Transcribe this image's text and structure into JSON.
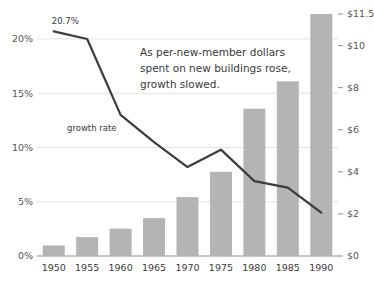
{
  "chart_data": {
    "type": "bar",
    "title": "",
    "subtitle": "",
    "annotation": {
      "lines": [
        "As per-new-member dollars",
        "spent on new buildings rose,",
        "growth slowed."
      ]
    },
    "categories": [
      "1950",
      "1955",
      "1960",
      "1965",
      "1970",
      "1975",
      "1980",
      "1985",
      "1990"
    ],
    "xlabel": "",
    "series": [
      {
        "name": "per-new-member dollars",
        "type": "bar",
        "axis": "right",
        "values": [
          0.5,
          0.9,
          1.3,
          1.8,
          2.8,
          4.0,
          7.0,
          8.3,
          11.5
        ],
        "color": "#b4b4b4"
      },
      {
        "name": "growth rate",
        "type": "line",
        "axis": "left",
        "values": [
          20.7,
          20.0,
          13.0,
          10.5,
          8.2,
          9.8,
          6.9,
          6.3,
          4.0
        ],
        "color": "#3c3c3c",
        "inline_label": "growth rate",
        "first_point_label": "20.7%"
      }
    ],
    "left_axis": {
      "ylabel": "",
      "ticks": [
        "0%",
        "5%",
        "10%",
        "15%",
        "20%"
      ],
      "tick_values": [
        0,
        5,
        10,
        15,
        20
      ],
      "ylim": [
        0,
        22.3
      ]
    },
    "right_axis": {
      "ylabel": "",
      "ticks": [
        "$0",
        "$2",
        "$4",
        "$6",
        "$8",
        "$10",
        "$11.5"
      ],
      "tick_values": [
        0,
        2,
        4,
        6,
        8,
        10,
        11.5
      ],
      "ylim": [
        0,
        11.5
      ]
    },
    "grid": true,
    "legend_position": "inline"
  },
  "colors": {
    "bar": "#b4b4b4",
    "line": "#3c3c3c",
    "grid": "#e2e2e2",
    "axis": "#8d8d8d",
    "text": "#3a3a3a"
  }
}
